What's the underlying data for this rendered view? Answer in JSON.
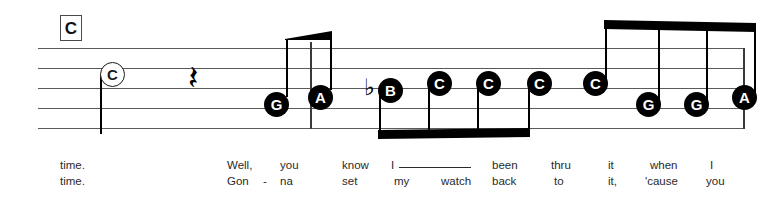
{
  "score": {
    "chord": {
      "symbol": "C"
    },
    "staff": {
      "line_count": 5
    },
    "notation": {
      "rest_glyph": "𝄽",
      "flat_glyph": "♭",
      "notes": [
        {
          "name": "C",
          "style": "hollow",
          "x": 62,
          "y": 14,
          "stem": "down"
        },
        {
          "name": "G",
          "style": "filled",
          "x": 226,
          "y": 44,
          "stem": "up"
        },
        {
          "name": "A",
          "style": "filled",
          "x": 270,
          "y": 37,
          "stem": "up"
        },
        {
          "name": "B",
          "style": "filled",
          "x": 340,
          "y": 30,
          "stem": "down",
          "accidental": "flat"
        },
        {
          "name": "C",
          "style": "filled",
          "x": 389,
          "y": 23,
          "stem": "down"
        },
        {
          "name": "C",
          "style": "filled",
          "x": 438,
          "y": 23,
          "stem": "down"
        },
        {
          "name": "C",
          "style": "filled",
          "x": 489,
          "y": 23,
          "stem": "down"
        },
        {
          "name": "C",
          "style": "filled",
          "x": 545,
          "y": 23,
          "stem": "up"
        },
        {
          "name": "G",
          "style": "filled",
          "x": 598,
          "y": 44,
          "stem": "up"
        },
        {
          "name": "G",
          "style": "filled",
          "x": 646,
          "y": 44,
          "stem": "up"
        },
        {
          "name": "A",
          "style": "filled",
          "x": 694,
          "y": 37,
          "stem": "up"
        }
      ],
      "barlines": [
        {
          "x": 272
        },
        {
          "x": 707
        }
      ]
    },
    "lyrics": {
      "verse1": [
        {
          "text": "time.",
          "x": 60
        },
        {
          "text": "Well,",
          "x": 227
        },
        {
          "text": "you",
          "x": 280
        },
        {
          "text": "know",
          "x": 342
        },
        {
          "text": "I",
          "x": 391
        },
        {
          "text": "been",
          "x": 492
        },
        {
          "text": "thru",
          "x": 551
        },
        {
          "text": "it",
          "x": 608
        },
        {
          "text": "when",
          "x": 650
        },
        {
          "text": "I",
          "x": 710
        }
      ],
      "verse2": [
        {
          "text": "time.",
          "x": 60
        },
        {
          "text": "Gon",
          "x": 227
        },
        {
          "text": "-",
          "x": 263
        },
        {
          "text": "na",
          "x": 280
        },
        {
          "text": "set",
          "x": 342
        },
        {
          "text": "my",
          "x": 394
        },
        {
          "text": "watch",
          "x": 441
        },
        {
          "text": "back",
          "x": 492
        },
        {
          "text": "to",
          "x": 554
        },
        {
          "text": "it,",
          "x": 608
        },
        {
          "text": "'cause",
          "x": 645
        },
        {
          "text": "you",
          "x": 706
        }
      ],
      "melisma": {
        "x": 399,
        "y": 166,
        "width": 72
      }
    }
  }
}
